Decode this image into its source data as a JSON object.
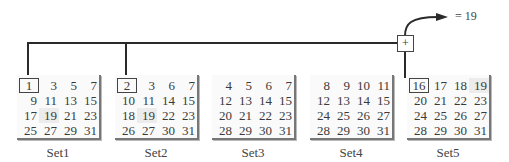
{
  "result": {
    "text": "= 19",
    "operator": "+"
  },
  "sets": [
    {
      "label": "Set1",
      "numbers": [
        1,
        3,
        5,
        7,
        9,
        11,
        13,
        15,
        17,
        19,
        21,
        23,
        25,
        27,
        29,
        31
      ],
      "boxed": 0,
      "shaded": [
        9
      ]
    },
    {
      "label": "Set2",
      "numbers": [
        2,
        3,
        6,
        7,
        10,
        11,
        14,
        15,
        18,
        19,
        22,
        23,
        26,
        27,
        30,
        31
      ],
      "boxed": 0,
      "shaded": [
        9
      ]
    },
    {
      "label": "Set3",
      "numbers": [
        4,
        5,
        6,
        7,
        12,
        13,
        14,
        15,
        20,
        21,
        22,
        23,
        28,
        29,
        30,
        31
      ],
      "boxed": null,
      "shaded": []
    },
    {
      "label": "Set4",
      "numbers": [
        8,
        9,
        10,
        11,
        12,
        13,
        14,
        15,
        24,
        25,
        26,
        27,
        28,
        29,
        30,
        31
      ],
      "boxed": null,
      "shaded": []
    },
    {
      "label": "Set5",
      "numbers": [
        16,
        17,
        18,
        19,
        20,
        21,
        22,
        23,
        24,
        25,
        26,
        27,
        28,
        29,
        30,
        31
      ],
      "boxed": 0,
      "shaded": [
        3
      ]
    }
  ]
}
